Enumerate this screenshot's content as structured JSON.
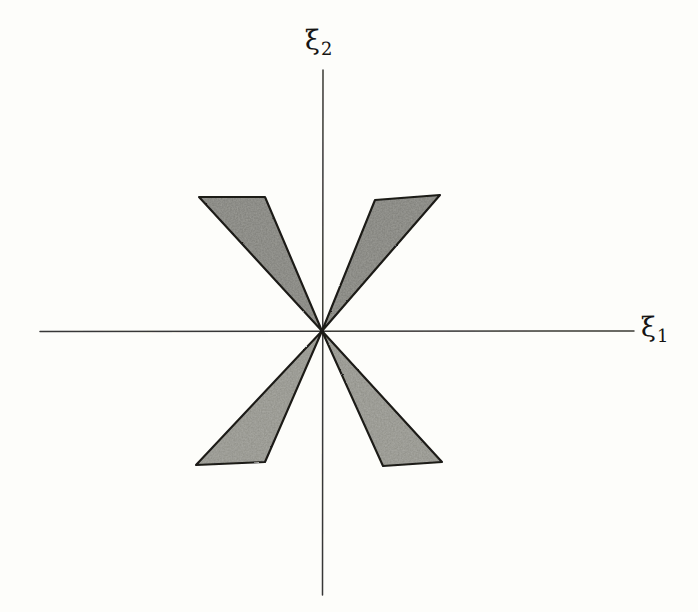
{
  "figure": {
    "medium": "pencil-on-paper scan",
    "width": 698,
    "height": 612,
    "background_color": "#fdfdfa"
  },
  "axes": {
    "horizontal": {
      "name": "xi-1-axis",
      "label": "ξ",
      "subscript": "1",
      "x_start": 40,
      "x_end": 634,
      "y": 331,
      "color": "#2a2926",
      "label_x": 641,
      "label_y": 313
    },
    "vertical": {
      "name": "xi-2-axis",
      "label": "ξ",
      "subscript": "2",
      "y_start": 70,
      "y_end": 595,
      "x": 323,
      "color": "#2a2926",
      "label_x": 305,
      "label_y": 26
    },
    "origin": {
      "x": 322,
      "y": 331
    }
  },
  "style": {
    "outline_color": "#1b1a17",
    "outline_width": 2.1,
    "fill_color": "#9c9c97",
    "fill_color_light": "#b4b4ae",
    "fill_opacity": 0.92,
    "axis_width": 1.5
  },
  "chart_data": {
    "type": "scatter",
    "xlabel": "ξ₁",
    "ylabel": "ξ₂",
    "grid": false,
    "legend": "none",
    "axis_origin_px": [
      322,
      331
    ],
    "xlim_px": [
      40,
      634
    ],
    "ylim_px": [
      70,
      595
    ],
    "regions": [
      {
        "name": "upper-left-cone",
        "quadrant": "II",
        "apex_px": [
          322,
          331
        ],
        "outer_edge_px": [
          [
            199,
            197
          ],
          [
            265,
            197
          ]
        ],
        "polygon_px": [
          [
            322,
            331
          ],
          [
            199,
            197
          ],
          [
            265,
            197
          ]
        ],
        "fill": "#9c9c97"
      },
      {
        "name": "upper-right-cone",
        "quadrant": "I",
        "apex_px": [
          322,
          331
        ],
        "outer_edge_px": [
          [
            375,
            200
          ],
          [
            440,
            195
          ]
        ],
        "polygon_px": [
          [
            322,
            331
          ],
          [
            375,
            200
          ],
          [
            440,
            195
          ]
        ],
        "fill": "#9c9c97"
      },
      {
        "name": "lower-left-cone",
        "quadrant": "III",
        "apex_px": [
          322,
          331
        ],
        "outer_edge_px": [
          [
            196,
            465
          ],
          [
            265,
            462
          ]
        ],
        "polygon_px": [
          [
            322,
            331
          ],
          [
            196,
            465
          ],
          [
            265,
            462
          ]
        ],
        "fill": "#a8a8a2"
      },
      {
        "name": "lower-right-cone",
        "quadrant": "IV",
        "apex_px": [
          322,
          331
        ],
        "outer_edge_px": [
          [
            383,
            466
          ],
          [
            442,
            462
          ]
        ],
        "polygon_px": [
          [
            322,
            331
          ],
          [
            383,
            466
          ],
          [
            442,
            462
          ]
        ],
        "fill": "#a8a8a2"
      }
    ]
  }
}
